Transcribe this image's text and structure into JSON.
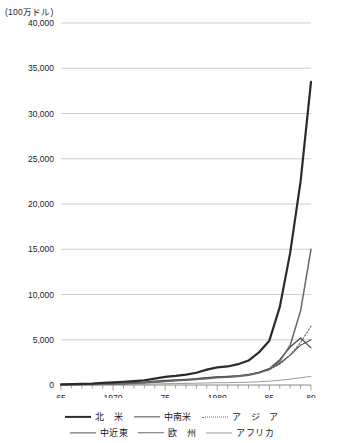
{
  "unit_label": "(100万ドル)",
  "legend": {
    "rows": [
      [
        {
          "label": "北　米",
          "color": "#2b2b2b",
          "style": "solid",
          "width": 2.2,
          "name": "north-america"
        },
        {
          "label": "中南米",
          "color": "#4a4a4a",
          "style": "solid",
          "width": 1.3,
          "name": "latin-america"
        },
        {
          "label": "ア　ジ　ア",
          "color": "#6e6e6e",
          "style": "dotted",
          "width": 1.2,
          "name": "asia"
        }
      ],
      [
        {
          "label": "中近東",
          "color": "#555555",
          "style": "solid",
          "width": 1.2,
          "name": "middle-east"
        },
        {
          "label": "欧　州",
          "color": "#6a6a6a",
          "style": "solid",
          "width": 1.5,
          "name": "europe"
        },
        {
          "label": "アフリカ",
          "color": "#9a9a9a",
          "style": "solid",
          "width": 1.0,
          "name": "africa"
        }
      ]
    ]
  },
  "chart_data": {
    "type": "line",
    "title": "",
    "xlabel": "",
    "ylabel": "(100万ドル)",
    "ylim": [
      0,
      40000
    ],
    "xlim": [
      65,
      89
    ],
    "grid": true,
    "legend_position": "bottom",
    "y_ticks": [
      0,
      5000,
      10000,
      15000,
      20000,
      25000,
      30000,
      35000,
      40000
    ],
    "y_tick_labels": [
      "0",
      "5,000",
      "10,000",
      "15,000",
      "20,000",
      "25,000",
      "30,000",
      "35,000",
      "40,000"
    ],
    "x_ticks": [
      65,
      70,
      75,
      80,
      85,
      89
    ],
    "x_tick_labels": [
      "65",
      "1970",
      "75",
      "1980",
      "85",
      "89"
    ],
    "x": [
      65,
      66,
      67,
      68,
      69,
      70,
      71,
      72,
      73,
      74,
      75,
      76,
      77,
      78,
      79,
      80,
      81,
      82,
      83,
      84,
      85,
      86,
      87,
      88,
      89
    ],
    "series": [
      {
        "name": "北　米",
        "color": "#2b2b2b",
        "style": "solid",
        "width": 2.2,
        "values": [
          60,
          90,
          120,
          160,
          230,
          300,
          360,
          430,
          520,
          700,
          900,
          1000,
          1150,
          1350,
          1700,
          1950,
          2050,
          2300,
          2700,
          3600,
          4900,
          8600,
          14600,
          22500,
          33500
        ]
      },
      {
        "name": "中南米",
        "color": "#4a4a4a",
        "style": "solid",
        "width": 1.3,
        "values": [
          40,
          60,
          80,
          100,
          140,
          180,
          220,
          260,
          320,
          420,
          520,
          560,
          620,
          700,
          820,
          900,
          940,
          1000,
          1150,
          1400,
          1800,
          2800,
          4200,
          5200,
          4100
        ]
      },
      {
        "name": "ア　ジ　ア",
        "color": "#6e6e6e",
        "style": "dotted",
        "width": 1.2,
        "values": [
          20,
          30,
          45,
          60,
          80,
          110,
          140,
          180,
          230,
          300,
          400,
          480,
          560,
          640,
          760,
          850,
          900,
          980,
          1100,
          1350,
          1700,
          2300,
          3300,
          4700,
          6500
        ]
      },
      {
        "name": "中近東",
        "color": "#555555",
        "style": "solid",
        "width": 1.2,
        "values": [
          30,
          40,
          55,
          70,
          95,
          130,
          160,
          200,
          250,
          330,
          430,
          500,
          580,
          660,
          780,
          870,
          920,
          1000,
          1150,
          1400,
          1750,
          2400,
          3300,
          4400,
          5000
        ]
      },
      {
        "name": "欧　州",
        "color": "#6a6a6a",
        "style": "solid",
        "width": 1.5,
        "values": [
          25,
          35,
          50,
          65,
          90,
          120,
          150,
          190,
          240,
          310,
          400,
          460,
          530,
          600,
          700,
          800,
          860,
          940,
          1080,
          1320,
          1700,
          2600,
          4400,
          8200,
          15000
        ]
      },
      {
        "name": "アフリカ",
        "color": "#9a9a9a",
        "style": "solid",
        "width": 1.0,
        "values": [
          10,
          15,
          20,
          25,
          35,
          45,
          55,
          70,
          90,
          110,
          140,
          160,
          180,
          200,
          230,
          250,
          260,
          280,
          310,
          360,
          430,
          520,
          650,
          800,
          950
        ]
      }
    ]
  }
}
